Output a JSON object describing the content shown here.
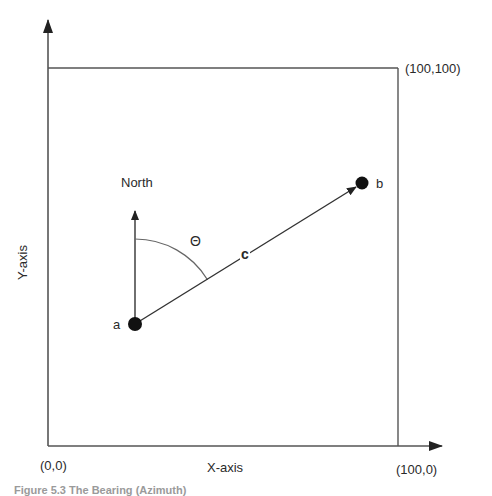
{
  "diagram": {
    "type": "bearing-diagram",
    "labels": {
      "top_right_corner": "(100,100)",
      "origin": "(0,0)",
      "bottom_right_corner": "(100,0)",
      "x_axis": "X-axis",
      "y_axis": "Y-axis",
      "north": "North",
      "angle": "Θ",
      "vector": "c",
      "point_a": "a",
      "point_b": "b"
    },
    "caption": "Figure 5.3 The Bearing (Azimuth)",
    "points": [
      {
        "name": "a",
        "x": 135,
        "y": 324
      },
      {
        "name": "b",
        "x": 362,
        "y": 183
      }
    ],
    "colors": {
      "line": "#3a3a3a",
      "point": "#111111",
      "arc": "#555555"
    }
  }
}
